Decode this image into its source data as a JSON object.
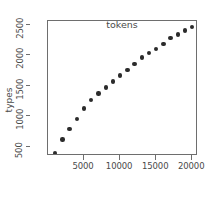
{
  "chart_data": {
    "type": "scatter",
    "title": "",
    "xlabel": "tokens",
    "ylabel": "types",
    "xlim": [
      0,
      20800
    ],
    "ylim": [
      350,
      2560
    ],
    "grid": false,
    "legend": null,
    "xticks": [
      5000,
      10000,
      15000,
      20000
    ],
    "xtick_labels": [
      "5000",
      "10000",
      "15000",
      "20000"
    ],
    "yticks": [
      500,
      1000,
      1500,
      2000,
      2500
    ],
    "ytick_labels": [
      "500",
      "1000",
      "1500",
      "2000",
      "2500"
    ],
    "marker": "filled-circle",
    "marker_color": "#2b2b2b",
    "x": [
      1000,
      2000,
      3000,
      4000,
      5000,
      6000,
      7000,
      8000,
      9000,
      10000,
      11000,
      12000,
      13000,
      14000,
      15000,
      16000,
      17000,
      18000,
      19000,
      20000
    ],
    "y": [
      400,
      620,
      790,
      955,
      1130,
      1270,
      1375,
      1470,
      1570,
      1670,
      1760,
      1855,
      1960,
      2040,
      2105,
      2180,
      2280,
      2340,
      2405,
      2460
    ],
    "points": [
      {
        "x": 1000,
        "y": 400
      },
      {
        "x": 2000,
        "y": 620
      },
      {
        "x": 3000,
        "y": 790
      },
      {
        "x": 4000,
        "y": 955
      },
      {
        "x": 5000,
        "y": 1130
      },
      {
        "x": 6000,
        "y": 1270
      },
      {
        "x": 7000,
        "y": 1375
      },
      {
        "x": 8000,
        "y": 1470
      },
      {
        "x": 9000,
        "y": 1570
      },
      {
        "x": 10000,
        "y": 1670
      },
      {
        "x": 11000,
        "y": 1760
      },
      {
        "x": 12000,
        "y": 1855
      },
      {
        "x": 13000,
        "y": 1960
      },
      {
        "x": 14000,
        "y": 2040
      },
      {
        "x": 15000,
        "y": 2105
      },
      {
        "x": 16000,
        "y": 2180
      },
      {
        "x": 17000,
        "y": 2280
      },
      {
        "x": 18000,
        "y": 2340
      },
      {
        "x": 19000,
        "y": 2405
      },
      {
        "x": 20000,
        "y": 2460
      }
    ]
  },
  "colors": {
    "axis": "#6e6e6e",
    "text": "#4a4a4a",
    "marker": "#2b2b2b",
    "background": "#ffffff"
  }
}
